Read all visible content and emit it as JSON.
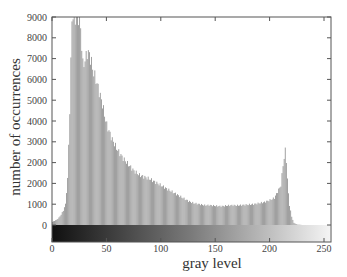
{
  "chart_data": {
    "type": "bar",
    "title": "",
    "xlabel": "gray level",
    "ylabel": "number of occurrences",
    "x_ticks": [
      0,
      50,
      100,
      150,
      200,
      250
    ],
    "y_tick_labels": [
      "0",
      "1000",
      "2000",
      "2000",
      "3000",
      "4000",
      "5000",
      "6000",
      "7000",
      "8000",
      "9000"
    ],
    "xlim": [
      0,
      255
    ],
    "ylim": [
      0,
      10000
    ],
    "grid": false,
    "legend": null,
    "colorbar": "grayscale gradient 0 (black) to 255 (white) below x-axis",
    "bar_color": "#8c8c8c",
    "x": [
      0,
      2,
      4,
      6,
      8,
      10,
      12,
      14,
      16,
      18,
      20,
      22,
      24,
      26,
      28,
      30,
      32,
      34,
      36,
      38,
      40,
      42,
      44,
      46,
      48,
      50,
      55,
      60,
      65,
      70,
      75,
      80,
      85,
      90,
      95,
      100,
      105,
      110,
      115,
      120,
      125,
      130,
      135,
      140,
      145,
      150,
      155,
      160,
      165,
      170,
      175,
      180,
      185,
      190,
      195,
      200,
      204,
      206,
      208,
      210,
      212,
      213,
      214,
      215,
      216,
      217,
      218,
      220,
      222,
      225,
      230,
      240,
      250,
      255
    ],
    "values": [
      150,
      200,
      250,
      350,
      500,
      700,
      1000,
      2200,
      5500,
      10000,
      10000,
      10000,
      10000,
      9500,
      7700,
      7900,
      8300,
      8200,
      7800,
      7300,
      7000,
      6600,
      6200,
      5800,
      5300,
      4800,
      4100,
      3600,
      3200,
      2900,
      2600,
      2400,
      2300,
      2200,
      2050,
      1900,
      1750,
      1600,
      1450,
      1300,
      1150,
      1050,
      1000,
      950,
      950,
      920,
      900,
      930,
      950,
      940,
      960,
      980,
      1000,
      1050,
      1100,
      1200,
      1300,
      1500,
      1700,
      1900,
      2900,
      3200,
      3600,
      3100,
      2200,
      1500,
      950,
      400,
      100,
      20,
      0,
      0,
      0,
      0
    ]
  }
}
